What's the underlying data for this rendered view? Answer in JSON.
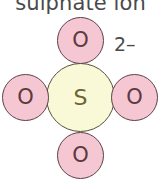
{
  "figure": {
    "title": "sulphate ion",
    "background_color": "#ffffff",
    "width": 161,
    "height": 195
  },
  "charge": {
    "label": "2–"
  },
  "colors": {
    "oxygen_fill": "#f5c7d2",
    "oxygen_stroke": "#5c4246",
    "oxygen_text": "#5c3a40",
    "sulfur_fill": "#f9f9d7",
    "sulfur_stroke": "#54513a",
    "sulfur_text": "#6b6433",
    "title_text": "#4a4a4a",
    "charge_text": "#4a4a4a"
  },
  "diagram": {
    "type": "molecule-ball-model",
    "center_atom": {
      "symbol": "S",
      "element": "sulfur",
      "position": "center",
      "cx": 81,
      "cy": 98,
      "diameter": 69
    },
    "outer_atoms": [
      {
        "symbol": "O",
        "element": "oxygen",
        "position": "top",
        "cx": 81,
        "cy": 41,
        "diameter": 47
      },
      {
        "symbol": "O",
        "element": "oxygen",
        "position": "left",
        "cx": 26,
        "cy": 98,
        "diameter": 47
      },
      {
        "symbol": "O",
        "element": "oxygen",
        "position": "right",
        "cx": 135,
        "cy": 98,
        "diameter": 47
      },
      {
        "symbol": "O",
        "element": "oxygen",
        "position": "bottom",
        "cx": 81,
        "cy": 156,
        "diameter": 47
      }
    ]
  }
}
